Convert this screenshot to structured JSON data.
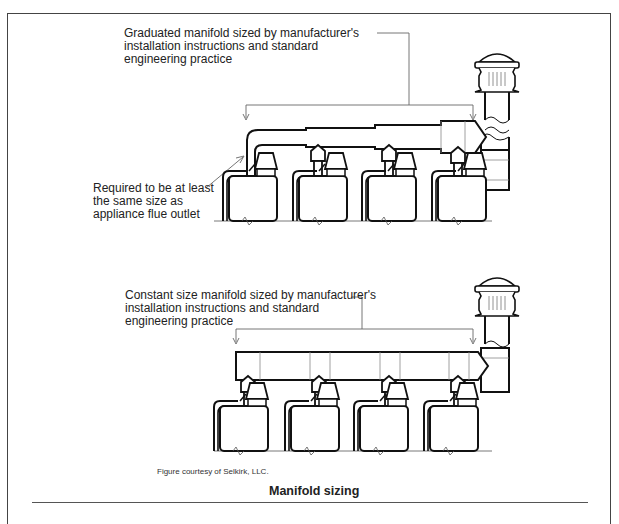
{
  "figure": {
    "top_diagram": {
      "title": "Graduated manifold",
      "label_main": "Graduated manifold sized by manufacturer's\ninstallation instructions and standard\nengineering practice",
      "label_connector": "Required to be at least\nthe same size as\nappliance flue outlet",
      "appliance_count": 4
    },
    "bottom_diagram": {
      "title": "Constant size manifold",
      "label_main": "Constant size manifold sized by manufacturer's\ninstallation instructions and standard\nengineering practice",
      "appliance_count": 4
    },
    "credit": "Figure courtesy of Selkirk, LLC.",
    "caption": "Manifold sizing"
  }
}
